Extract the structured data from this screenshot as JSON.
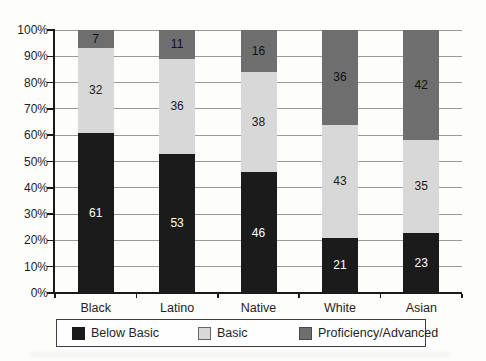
{
  "chart_data": {
    "type": "bar",
    "variant": "stacked-100-percent",
    "title": "",
    "xlabel": "",
    "ylabel": "",
    "categories": [
      "Black",
      "Latino",
      "Native",
      "White",
      "Asian"
    ],
    "series": [
      {
        "name": "Below Basic",
        "color": "#1b1b1b",
        "label_color": "#ffffff",
        "values": [
          61,
          53,
          46,
          21,
          23
        ]
      },
      {
        "name": "Basic",
        "color": "#d8d8d8",
        "label_color": "#1b1b1b",
        "values": [
          32,
          36,
          38,
          43,
          35
        ]
      },
      {
        "name": "Proficiency/Advanced",
        "color": "#6e6e6e",
        "label_color": "#111111",
        "values": [
          7,
          11,
          16,
          36,
          42
        ]
      }
    ],
    "y_axis": {
      "min": 0,
      "max": 100,
      "tick_step": 10,
      "ticks": [
        "0%",
        "10%",
        "20%",
        "30%",
        "40%",
        "50%",
        "60%",
        "70%",
        "80%",
        "90%",
        "100%"
      ],
      "grid": true
    },
    "legend": {
      "position": "bottom",
      "items": [
        "Below Basic",
        "Basic",
        "Proficiency/Advanced"
      ]
    },
    "colors": {
      "gridline": "#999999",
      "axis": "#1a1a1a",
      "text": "#1f1f1f",
      "legend_border": "#3f3f3f"
    }
  }
}
